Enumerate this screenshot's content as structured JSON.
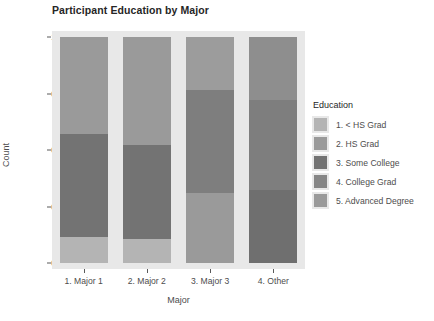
{
  "chart_data": {
    "type": "bar",
    "stacked": true,
    "title": "Participant Education by Major",
    "xlabel": "Major",
    "ylabel": "Count",
    "ylim": [
      0,
      1
    ],
    "ytick_labels": [
      "0.00",
      "0.25",
      "0.50",
      "0.75",
      "1.00"
    ],
    "ytick_values": [
      0,
      0.25,
      0.5,
      0.75,
      1
    ],
    "grid": false,
    "legend_position": "right",
    "legend_title": "Education",
    "categories": [
      "1. Major 1",
      "2. Major 2",
      "3. Major 3",
      "4. Other"
    ],
    "series": [
      {
        "name": "1. < HS Grad",
        "color": "#b4b4b4",
        "values": [
          0.115,
          0.105,
          0.0,
          0.0
        ]
      },
      {
        "name": "2. HS Grad",
        "color": "#9a9a9a",
        "values": [
          0.0,
          0.0,
          0.31,
          0.0
        ]
      },
      {
        "name": "3. Some College",
        "color": "#737373",
        "values": [
          0.455,
          0.415,
          0.0,
          0.325
        ]
      },
      {
        "name": "4. College Grad",
        "color": "#868686",
        "values": [
          0.0,
          0.0,
          0.455,
          0.395
        ]
      },
      {
        "name": "5. Advanced Degree",
        "color": "#9a9a9a",
        "values": [
          0.43,
          0.48,
          0.235,
          0.28
        ]
      }
    ],
    "bars": [
      {
        "category": "1. Major 1",
        "segments": [
          {
            "series": "5. Advanced Degree",
            "value": 0.43,
            "color": "#9a9a9a"
          },
          {
            "series": "3. Some College",
            "value": 0.455,
            "color": "#737373"
          },
          {
            "series": "1. < HS Grad",
            "value": 0.115,
            "color": "#b4b4b4"
          }
        ]
      },
      {
        "category": "2. Major 2",
        "segments": [
          {
            "series": "5. Advanced Degree",
            "value": 0.48,
            "color": "#9a9a9a"
          },
          {
            "series": "3. Some College",
            "value": 0.415,
            "color": "#737373"
          },
          {
            "series": "1. < HS Grad",
            "value": 0.105,
            "color": "#b4b4b4"
          }
        ]
      },
      {
        "category": "3. Major 3",
        "segments": [
          {
            "series": "5. Advanced Degree",
            "value": 0.235,
            "color": "#9c9c9c"
          },
          {
            "series": "4. College Grad",
            "value": 0.455,
            "color": "#7e7e7e"
          },
          {
            "series": "2. HS Grad",
            "value": 0.31,
            "color": "#9a9a9a"
          }
        ]
      },
      {
        "category": "4. Other",
        "segments": [
          {
            "series": "5. Advanced Degree",
            "value": 0.28,
            "color": "#8e8e8e"
          },
          {
            "series": "4. College Grad",
            "value": 0.395,
            "color": "#7e7e7e"
          },
          {
            "series": "3. Some College",
            "value": 0.325,
            "color": "#6f6f6f"
          }
        ]
      }
    ]
  },
  "colors": {
    "panel_background": "#e8e8e8",
    "axis_text": "#4d4d4d",
    "title_text": "#262626"
  }
}
